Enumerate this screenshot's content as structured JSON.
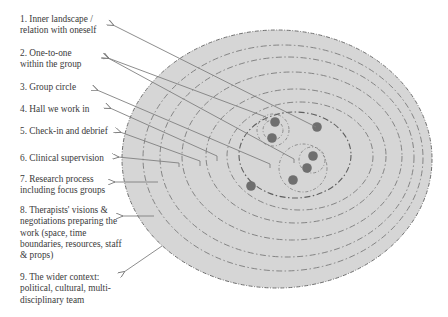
{
  "diagram": {
    "labels": [
      {
        "id": 1,
        "text": "1. Inner landscape /\nrelation with oneself"
      },
      {
        "id": 2,
        "text": "2. One-to-one\nwithin the group"
      },
      {
        "id": 3,
        "text": "3. Group circle"
      },
      {
        "id": 4,
        "text": "4. Hall we work in"
      },
      {
        "id": 5,
        "text": "5. Check-in and debrief"
      },
      {
        "id": 6,
        "text": "6. Clinical supervision"
      },
      {
        "id": 7,
        "text": "7. Research process\nincluding focus groups"
      },
      {
        "id": 8,
        "text": "8. Therapists' visions &\nnegotiations preparing the\nwork (space, time\nboundaries, resources, staff\n& props)"
      },
      {
        "id": 9,
        "text": "9. The wider context:\npolitical, cultural, multi-\ndisciplinary team"
      }
    ],
    "colors": {
      "fill": "#d6d6d6",
      "ring_stroke": "#6e6e6e",
      "arrow": "#808080",
      "dot": "#6f6f6f",
      "text": "#3a3a3a"
    }
  }
}
